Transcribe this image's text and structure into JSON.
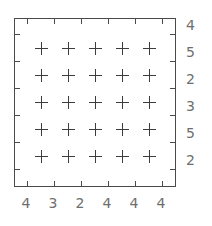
{
  "chart_data": {
    "type": "scatter",
    "title": "",
    "subtitle": "",
    "xlabel": "",
    "ylabel": "",
    "grid": false,
    "legend": null,
    "marker": "plus",
    "marker_color": "#3c3c3c",
    "frame_color": "#4a4a4a",
    "label_color": "#6e6e6e",
    "axis_label_position": {
      "x_axis": "bottom",
      "y_axis": "right"
    },
    "x_tick_labels": [
      "4",
      "3",
      "2",
      "4",
      "4",
      "4"
    ],
    "y_tick_labels": [
      "4",
      "5",
      "2",
      "3",
      "5",
      "2"
    ],
    "x_tick_count": 6,
    "y_tick_count": 6,
    "points": [
      {
        "col": 0,
        "row": 0
      },
      {
        "col": 1,
        "row": 0
      },
      {
        "col": 2,
        "row": 0
      },
      {
        "col": 3,
        "row": 0
      },
      {
        "col": 4,
        "row": 0
      },
      {
        "col": 0,
        "row": 1
      },
      {
        "col": 1,
        "row": 1
      },
      {
        "col": 2,
        "row": 1
      },
      {
        "col": 3,
        "row": 1
      },
      {
        "col": 4,
        "row": 1
      },
      {
        "col": 0,
        "row": 2
      },
      {
        "col": 1,
        "row": 2
      },
      {
        "col": 2,
        "row": 2
      },
      {
        "col": 3,
        "row": 2
      },
      {
        "col": 4,
        "row": 2
      },
      {
        "col": 0,
        "row": 3
      },
      {
        "col": 1,
        "row": 3
      },
      {
        "col": 2,
        "row": 3
      },
      {
        "col": 3,
        "row": 3
      },
      {
        "col": 4,
        "row": 3
      },
      {
        "col": 0,
        "row": 4
      },
      {
        "col": 1,
        "row": 4
      },
      {
        "col": 2,
        "row": 4
      },
      {
        "col": 3,
        "row": 4
      },
      {
        "col": 4,
        "row": 4
      }
    ],
    "point_count": 25,
    "grid_rows": 5,
    "grid_cols": 5
  },
  "geometry": {
    "frame_left": 14,
    "frame_top": 18,
    "frame_width": 162,
    "frame_height": 169,
    "marker_x": [
      27,
      54,
      81,
      108,
      135
    ],
    "marker_y": [
      30,
      57,
      84,
      111,
      138
    ],
    "tick_x": [
      13,
      40,
      67,
      94,
      121,
      148
    ],
    "tick_y": [
      16,
      43,
      70,
      97,
      124,
      151
    ],
    "label_right_x": 186,
    "label_bottom_y": 196,
    "label_right_y": [
      25,
      52,
      79,
      106,
      133,
      160
    ],
    "label_bottom_x": [
      26,
      53,
      80,
      107,
      134,
      161
    ]
  }
}
